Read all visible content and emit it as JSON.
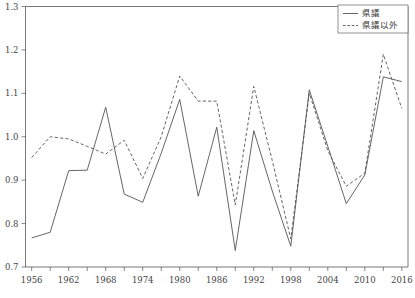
{
  "chart_data": {
    "type": "line",
    "title": "",
    "subtitle": "",
    "xlabel": "",
    "ylabel": "",
    "xlim": [
      1955,
      2017
    ],
    "ylim": [
      0.7,
      1.3
    ],
    "grid": false,
    "legend_position": "top-right",
    "x": [
      1956,
      1959,
      1962,
      1965,
      1968,
      1971,
      1974,
      1977,
      1980,
      1983,
      1986,
      1989,
      1992,
      1995,
      1998,
      2001,
      2004,
      2007,
      2010,
      2013,
      2016
    ],
    "x_tick_labels": [
      "1956",
      "1962",
      "1968",
      "1974",
      "1980",
      "1986",
      "1992",
      "1998",
      "2004",
      "2010",
      "2016"
    ],
    "x_tick_values": [
      1956,
      1962,
      1968,
      1974,
      1980,
      1986,
      1992,
      1998,
      2004,
      2010,
      2016
    ],
    "x_minor_tick_values": [
      1959,
      1965,
      1971,
      1977,
      1983,
      1989,
      1995,
      2001,
      2007,
      2013
    ],
    "y_tick_labels": [
      "0.7",
      "0.8",
      "0.9",
      "1.0",
      "1.1",
      "1.2",
      "1.3"
    ],
    "y_tick_values": [
      0.7,
      0.8,
      0.9,
      1.0,
      1.1,
      1.2,
      1.3
    ],
    "series": [
      {
        "name": "県議",
        "style": "solid",
        "color": "#555555",
        "values": [
          0.767,
          0.78,
          0.922,
          0.923,
          1.068,
          0.868,
          0.849,
          0.962,
          1.086,
          0.863,
          1.022,
          0.738,
          1.014,
          0.875,
          0.748,
          1.108,
          0.978,
          0.846,
          0.912,
          1.138,
          1.127
        ]
      },
      {
        "name": "県議以外",
        "style": "dashed",
        "color": "#555555",
        "values": [
          0.952,
          1.0,
          0.995,
          0.978,
          0.96,
          0.992,
          0.904,
          1.0,
          1.14,
          1.082,
          1.082,
          0.843,
          1.116,
          0.945,
          0.765,
          1.1,
          0.968,
          0.886,
          0.916,
          1.19,
          1.065
        ]
      }
    ]
  },
  "legend": {
    "entries": [
      {
        "label": "県議",
        "style": "solid"
      },
      {
        "label": "県議以外",
        "style": "dashed"
      }
    ]
  },
  "colors": {
    "line": "#555555",
    "axis": "#555555",
    "text": "#444444",
    "background": "#ffffff"
  }
}
